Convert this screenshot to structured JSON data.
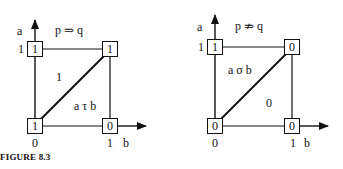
{
  "caption": "FIGURE 8.3",
  "diagrams": [
    {
      "title": "p ⇒ q",
      "vertical_axis": "a",
      "horizontal_axis": "b",
      "a_tick": "1",
      "origin_tick": "0",
      "b_tick": "1",
      "corners": {
        "top_left": "1",
        "top_right": "1",
        "bottom_left": "1",
        "bottom_right": "0"
      },
      "upper_region_label": "1",
      "lower_region_label": "a τ b"
    },
    {
      "title": "p ⇏ q",
      "vertical_axis": "a",
      "horizontal_axis": "b",
      "a_tick": "1",
      "origin_tick": "0",
      "b_tick": "1",
      "corners": {
        "top_left": "1",
        "top_right": "0",
        "bottom_left": "0",
        "bottom_right": "0"
      },
      "upper_region_label": "a σ b",
      "lower_region_label": "0"
    }
  ]
}
